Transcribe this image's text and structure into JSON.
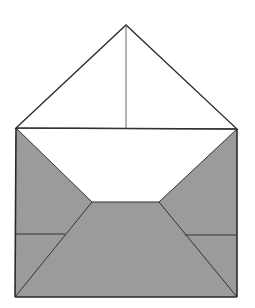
{
  "diagram": {
    "title": "",
    "colors": {
      "background": "#ffffff",
      "fill": "#9b9b9b",
      "stroke": "#2a2a2a",
      "fold_line": "#555555"
    },
    "points": {
      "apex": [
        126,
        25
      ],
      "top_left": [
        16,
        128
      ],
      "top_right": [
        237,
        129
      ],
      "bottom_left": [
        15,
        297
      ],
      "bottom_right": [
        237,
        297
      ],
      "inner_left": [
        92,
        202
      ],
      "inner_right": [
        159,
        202
      ],
      "left_fold_end": [
        65,
        234
      ],
      "right_fold_start": [
        185,
        235
      ],
      "flap_center_bottom": [
        126,
        129
      ]
    }
  }
}
